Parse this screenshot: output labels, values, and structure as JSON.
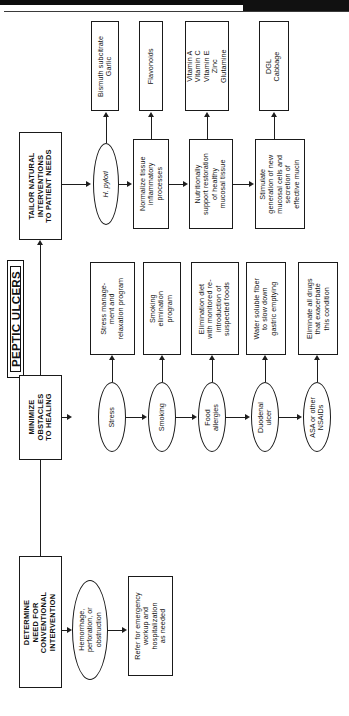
{
  "page": {
    "title": "PEPTIC ULCERS",
    "orientation": "rotated-90-ccw",
    "ink_color": "#1a1a1a",
    "background": "#ffffff"
  },
  "flow": {
    "stages": [
      {
        "id": "conventional",
        "header": "DETERMINE NEED FOR CONVENTIONAL INTERVENTION",
        "header_lines": [
          "DETERMINE",
          "NEED FOR",
          "CONVENTIONAL",
          "INTERVENTION"
        ],
        "conditions": [
          {
            "id": "hemorrhage",
            "label": "Hemorrhage, perforation, or obstruction",
            "label_lines": [
              "Hemorrhage,",
              "perforation, or",
              "obstruction"
            ],
            "intervention": {
              "label": "Refer for emergency workup and hospitalization as needed",
              "label_lines": [
                "Refer for emergency",
                "workup and",
                "hospitalization",
                "as needed"
              ]
            }
          }
        ]
      },
      {
        "id": "obstacles",
        "header": "MINIMIZE OBSTACLES TO HEALING",
        "header_lines": [
          "MINIMIZE",
          "OBSTACLES",
          "TO HEALING"
        ],
        "conditions": [
          {
            "id": "stress",
            "label": "Stress",
            "label_lines": [
              "Stress"
            ],
            "intervention": {
              "label": "Stress manage-ment and relaxation program",
              "label_lines": [
                "Stress manage-",
                "ment and",
                "relaxation program"
              ]
            }
          },
          {
            "id": "smoking",
            "label": "Smoking",
            "label_lines": [
              "Smoking"
            ],
            "intervention": {
              "label": "Smoking elimination program",
              "label_lines": [
                "Smoking",
                "elimination",
                "program"
              ]
            }
          },
          {
            "id": "food-allergies",
            "label": "Food allergies",
            "label_lines": [
              "Food",
              "allergies"
            ],
            "intervention": {
              "label": "Elimination diet with monitored re-introduction of suspected foods",
              "label_lines": [
                "Elimination diet",
                "with monitored re-",
                "introduction of",
                "suspected foods"
              ]
            }
          },
          {
            "id": "duodenal-ulcer",
            "label": "Duodenal ulcer",
            "label_lines": [
              "Duodenal",
              "ulcer"
            ],
            "intervention": {
              "label": "Water soluble fiber to slow down gastric emptying",
              "label_lines": [
                "Water soluble fiber",
                "to slow down",
                "gastric emptying"
              ]
            }
          },
          {
            "id": "asa-nsaids",
            "label": "ASA or other NSAIDs",
            "label_lines": [
              "ASA or other",
              "NSAIDs"
            ],
            "intervention": {
              "label": "Eliminate all drugs that exacerbate this condition",
              "label_lines": [
                "Eliminate all drugs",
                "that exacerbate",
                "this condition"
              ]
            }
          }
        ]
      },
      {
        "id": "tailor",
        "header": "TAILOR NATURAL INTERVENTIONS TO PATIENT NEEDS",
        "header_lines": [
          "TAILOR NATURAL",
          "INTERVENTIONS",
          "TO PATIENT NEEDS"
        ],
        "conditions": [
          {
            "id": "h-pylori",
            "label": "H. pylori",
            "label_lines": [
              "H. pylori"
            ],
            "italic": true,
            "intervention": {
              "label": "Bismuth subcitrate Garlic",
              "label_lines": [
                "Bismuth subcitrate",
                "Garlic"
              ]
            }
          },
          {
            "id": "normalize-inflammation",
            "label": "Normalize tissue inflammatory processes",
            "label_lines": [
              "Normalize tissue",
              "inflammatory",
              "processes"
            ],
            "intervention": {
              "label": "Flavonoids",
              "label_lines": [
                "Flavonoids"
              ]
            }
          },
          {
            "id": "nutritional-support",
            "label": "Nutritionally support restoration of healthy mucosal tissue",
            "label_lines": [
              "Nutritionally",
              "support restoration",
              "of healthy",
              "mucosal tissue"
            ],
            "intervention": {
              "label": "Vitamin A Vitamin C Vitamin E Zinc Glutamine",
              "label_lines": [
                "Vitamin A",
                "Vitamin C",
                "Vitamin E",
                "Zinc",
                "Glutamine"
              ]
            }
          },
          {
            "id": "stimulate-mucin",
            "label": "Stimulate generation of new mucosal cells and secretion of effective mucin",
            "label_lines": [
              "Stimulate",
              "generation of new",
              "mucosal cells and",
              "secretion of",
              "effective mucin"
            ],
            "intervention": {
              "label": "DGL Cabbage",
              "label_lines": [
                "DGL",
                "Cabbage"
              ]
            }
          }
        ]
      }
    ]
  }
}
